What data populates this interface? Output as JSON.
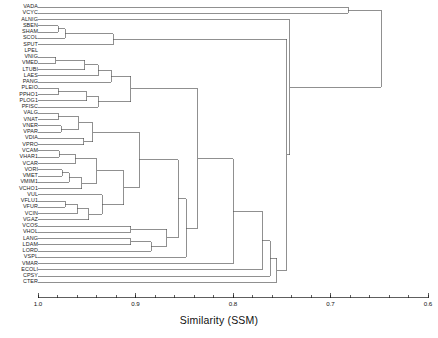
{
  "figure": {
    "type": "dendrogram",
    "axis_title": "Similarity (SSM)",
    "line_color": "#555555",
    "text_color": "#1a1a1a"
  },
  "axis": {
    "label": "Similarity (SSM)",
    "ticks": [
      "1.0",
      "0.9",
      "0.8",
      "0.7",
      "0.6"
    ],
    "tick_values": [
      1.0,
      0.9,
      0.8,
      0.7,
      0.6
    ],
    "minor_tick_step": 0.02,
    "range": [
      1.0,
      0.6
    ],
    "reversed": true,
    "orientation": "bottom"
  },
  "chart_data": {
    "type": "dendrogram",
    "title": "",
    "xlabel": "Similarity (SSM)",
    "ylabel": "",
    "xlim": [
      1.0,
      0.6
    ],
    "grid": false,
    "legend": "none",
    "similarity_metric": "SSM",
    "n_leaves": 45,
    "leaves": [
      "VADA",
      "VCYC",
      "ALNIG",
      "SBEN",
      "SHAM",
      "SCOL",
      "SPUT",
      "LPEL",
      "VNIG",
      "VMED",
      "LTUBI",
      "LAES",
      "PANG",
      "PLEIO",
      "PPHO1",
      "PLOG1",
      "PFISC",
      "VALG",
      "VNAT",
      "VNER",
      "VPAR",
      "VDIA",
      "VPRO",
      "VCAM",
      "VHAR1",
      "VCAR",
      "VORI",
      "VMET",
      "VMIM1",
      "VCHO1",
      "VUL",
      "VFLU1",
      "VFUR",
      "VCIN",
      "VGAZ",
      "VCOS",
      "VHOL",
      "LANG",
      "LDAM",
      "LORD",
      "VSPL",
      "VMAR",
      "ECOLI",
      "CPSY",
      "CTER"
    ],
    "merges": [
      {
        "id": "m1",
        "children": [
          "SBEN",
          "SHAM"
        ],
        "similarity": 0.979
      },
      {
        "id": "m2",
        "children": [
          "m1",
          "SCOL"
        ],
        "similarity": 0.972
      },
      {
        "id": "m3",
        "children": [
          "m2",
          "SPUT"
        ],
        "similarity": 0.923
      },
      {
        "id": "m4",
        "children": [
          "VNIG",
          "VMED"
        ],
        "similarity": 0.982
      },
      {
        "id": "m5",
        "children": [
          "m4",
          "LTUBI"
        ],
        "similarity": 0.952
      },
      {
        "id": "m6",
        "children": [
          "m5",
          "LAES"
        ],
        "similarity": 0.938
      },
      {
        "id": "m7",
        "children": [
          "PLEIO",
          "PPHO1"
        ],
        "similarity": 0.979
      },
      {
        "id": "m8",
        "children": [
          "m7",
          "PLOG1"
        ],
        "similarity": 0.95
      },
      {
        "id": "m9",
        "children": [
          "m8",
          "PFISC"
        ],
        "similarity": 0.938
      },
      {
        "id": "m10",
        "children": [
          "m6",
          "PANG"
        ],
        "similarity": 0.925
      },
      {
        "id": "m11",
        "children": [
          "m10",
          "m9"
        ],
        "similarity": 0.905
      },
      {
        "id": "m12",
        "children": [
          "VALG",
          "VNAT"
        ],
        "similarity": 0.979
      },
      {
        "id": "m13",
        "children": [
          "VNER",
          "VPAR"
        ],
        "similarity": 0.976
      },
      {
        "id": "m14",
        "children": [
          "m12",
          "m13"
        ],
        "similarity": 0.958
      },
      {
        "id": "m15",
        "children": [
          "VDIA",
          "VPRO"
        ],
        "similarity": 0.953
      },
      {
        "id": "m16",
        "children": [
          "m14",
          "m15"
        ],
        "similarity": 0.944
      },
      {
        "id": "m17",
        "children": [
          "VCAM",
          "VHAR1"
        ],
        "similarity": 0.978
      },
      {
        "id": "m18",
        "children": [
          "m17",
          "VCAR"
        ],
        "similarity": 0.962
      },
      {
        "id": "m19",
        "children": [
          "VORI",
          "VMET"
        ],
        "similarity": 0.975
      },
      {
        "id": "m20",
        "children": [
          "m19",
          "VMIM1"
        ],
        "similarity": 0.968
      },
      {
        "id": "m21",
        "children": [
          "m20",
          "VCHO1"
        ],
        "similarity": 0.955
      },
      {
        "id": "m22",
        "children": [
          "m18",
          "m21"
        ],
        "similarity": 0.94
      },
      {
        "id": "m23",
        "children": [
          "VFLU1",
          "VFUR"
        ],
        "similarity": 0.972
      },
      {
        "id": "m24",
        "children": [
          "m23",
          "VCIN"
        ],
        "similarity": 0.96
      },
      {
        "id": "m25",
        "children": [
          "m24",
          "VGAZ"
        ],
        "similarity": 0.948
      },
      {
        "id": "m26",
        "children": [
          "m25",
          "VUL"
        ],
        "similarity": 0.934
      },
      {
        "id": "m27",
        "children": [
          "m22",
          "m26"
        ],
        "similarity": 0.912
      },
      {
        "id": "m28",
        "children": [
          "m16",
          "m27"
        ],
        "similarity": 0.896
      },
      {
        "id": "m29",
        "children": [
          "VCOS",
          "VHOL"
        ],
        "similarity": 0.905
      },
      {
        "id": "m30",
        "children": [
          "LANG",
          "LDAM"
        ],
        "similarity": 0.905
      },
      {
        "id": "m31",
        "children": [
          "m30",
          "LORD"
        ],
        "similarity": 0.884
      },
      {
        "id": "m32",
        "children": [
          "m29",
          "m31"
        ],
        "similarity": 0.868
      },
      {
        "id": "m33",
        "children": [
          "m28",
          "m32"
        ],
        "similarity": 0.856
      },
      {
        "id": "m34",
        "children": [
          "m33",
          "VSPL"
        ],
        "similarity": 0.848
      },
      {
        "id": "m35",
        "children": [
          "m11",
          "m34"
        ],
        "similarity": 0.836
      },
      {
        "id": "m36",
        "children": [
          "m35",
          "VMAR"
        ],
        "similarity": 0.8
      },
      {
        "id": "m37",
        "children": [
          "m36",
          "ECOLI"
        ],
        "similarity": 0.77
      },
      {
        "id": "m38",
        "children": [
          "m37",
          "CPSY"
        ],
        "similarity": 0.762
      },
      {
        "id": "m39",
        "children": [
          "m38",
          "CTER"
        ],
        "similarity": 0.755
      },
      {
        "id": "m40",
        "children": [
          "m3",
          "m39"
        ],
        "similarity": 0.745
      },
      {
        "id": "m41",
        "children": [
          "ALNIG",
          "m40"
        ],
        "similarity": 0.742
      },
      {
        "id": "m42",
        "children": [
          "VADA",
          "VCYC"
        ],
        "similarity": 0.682
      },
      {
        "id": "m43",
        "children": [
          "m42",
          "m41"
        ],
        "similarity": 0.648
      }
    ]
  }
}
